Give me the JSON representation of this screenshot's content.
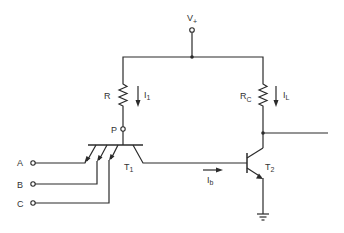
{
  "diagram": {
    "type": "circuit-schematic",
    "supply": {
      "label": "V",
      "sub": "+"
    },
    "resistors": [
      {
        "id": "R",
        "label": "R",
        "sub": ""
      },
      {
        "id": "RC",
        "label": "R",
        "sub": "C"
      }
    ],
    "currents": [
      {
        "id": "I1",
        "label": "I",
        "sub": "1",
        "direction": "down"
      },
      {
        "id": "IL",
        "label": "I",
        "sub": "L",
        "direction": "down"
      },
      {
        "id": "Ib",
        "label": "I",
        "sub": "b",
        "direction": "right"
      }
    ],
    "nodes": [
      {
        "id": "P",
        "label": "P"
      }
    ],
    "transistors": [
      {
        "id": "T1",
        "label": "T",
        "sub": "1",
        "type": "multi-emitter NPN"
      },
      {
        "id": "T2",
        "label": "T",
        "sub": "2",
        "type": "NPN"
      }
    ],
    "inputs": [
      {
        "id": "A",
        "label": "A"
      },
      {
        "id": "B",
        "label": "B"
      },
      {
        "id": "C",
        "label": "C"
      }
    ],
    "ground": {
      "present": true
    }
  }
}
